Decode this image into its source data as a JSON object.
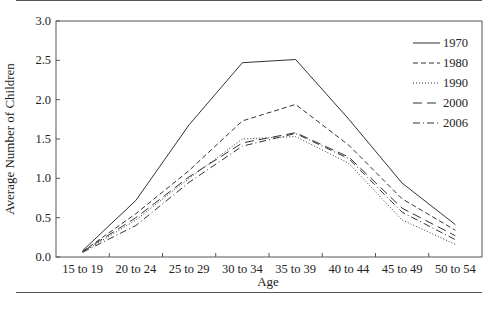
{
  "chart_data": {
    "type": "line",
    "title": "",
    "xlabel": "Age",
    "ylabel": "Average Number of Children",
    "categories": [
      "15 to 19",
      "20 to 24",
      "25 to 29",
      "30 to 34",
      "35 to 39",
      "40 to 44",
      "45 to 49",
      "50 to 54"
    ],
    "ylim": [
      0,
      3.0
    ],
    "yticks": [
      "0.0",
      "0.5",
      "1.0",
      "1.5",
      "2.0",
      "2.5",
      "3.0"
    ],
    "grid": false,
    "legend_position": "upper right (inside)",
    "series": [
      {
        "name": "1970",
        "style": "solid",
        "values": [
          0.08,
          0.72,
          1.68,
          2.47,
          2.51,
          1.75,
          0.94,
          0.41
        ]
      },
      {
        "name": "1980",
        "style": "dashed",
        "values": [
          0.07,
          0.55,
          1.1,
          1.73,
          1.94,
          1.42,
          0.74,
          0.34
        ]
      },
      {
        "name": "1990",
        "style": "dotted",
        "values": [
          0.06,
          0.47,
          1.0,
          1.5,
          1.53,
          1.19,
          0.47,
          0.16
        ]
      },
      {
        "name": "2000",
        "style": "longdash",
        "values": [
          0.07,
          0.5,
          1.02,
          1.45,
          1.58,
          1.27,
          0.62,
          0.27
        ]
      },
      {
        "name": "2006",
        "style": "dashdot",
        "values": [
          0.06,
          0.4,
          0.95,
          1.41,
          1.57,
          1.25,
          0.57,
          0.22
        ]
      }
    ]
  },
  "axis": {
    "x_title": "Age",
    "y_title": "Average Number of Children"
  },
  "legend": [
    "1970",
    "1980",
    "1990",
    "2000",
    "2006"
  ]
}
